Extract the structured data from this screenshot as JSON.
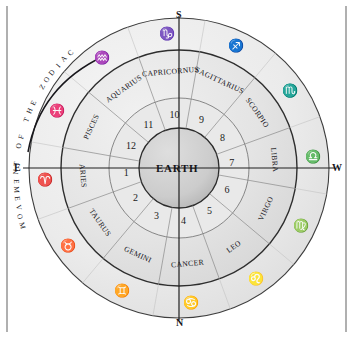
{
  "figure": {
    "center_label": "EARTH",
    "movement_caption": "MOVEMENT OF THE ZODIAC",
    "movement_arrow": "curved-arrow-clockwise"
  },
  "colors": {
    "ink": "#16151a",
    "rule": "#b0b0b0",
    "ring_fill": "#ededed",
    "band_fill": "#e6e6e6",
    "earth_fill": "#cfcfcf",
    "line": "#3a3a3a",
    "spoke": "#8d8d8d",
    "page": "#ffffff"
  },
  "compass": {
    "north": "N",
    "south": "S",
    "east": "E",
    "west": "W"
  },
  "houses": [
    {
      "number": "1",
      "angle_deg": 185
    },
    {
      "number": "2",
      "angle_deg": 215
    },
    {
      "number": "3",
      "angle_deg": 245
    },
    {
      "number": "4",
      "angle_deg": 275
    },
    {
      "number": "5",
      "angle_deg": 305
    },
    {
      "number": "6",
      "angle_deg": 335
    },
    {
      "number": "7",
      "angle_deg": 5
    },
    {
      "number": "8",
      "angle_deg": 35
    },
    {
      "number": "9",
      "angle_deg": 65
    },
    {
      "number": "10",
      "angle_deg": 95
    },
    {
      "number": "11",
      "angle_deg": 125
    },
    {
      "number": "12",
      "angle_deg": 155
    }
  ],
  "signs": [
    {
      "name": "ARIES",
      "glyph": "♈",
      "house": "1",
      "angle_deg": 185
    },
    {
      "name": "TAURUS",
      "glyph": "♉",
      "house": "2",
      "angle_deg": 215
    },
    {
      "name": "GEMINI",
      "glyph": "♊",
      "house": "3",
      "angle_deg": 245
    },
    {
      "name": "CANCER",
      "glyph": "♋",
      "house": "4",
      "angle_deg": 275
    },
    {
      "name": "LEO",
      "glyph": "♌",
      "house": "5",
      "angle_deg": 305
    },
    {
      "name": "VIRGO",
      "glyph": "♍",
      "house": "6",
      "angle_deg": 335
    },
    {
      "name": "LIBRA",
      "glyph": "♎",
      "house": "7",
      "angle_deg": 5
    },
    {
      "name": "SCORPIO",
      "glyph": "♏",
      "house": "8",
      "angle_deg": 35
    },
    {
      "name": "SAGITTARIUS",
      "glyph": "♐",
      "house": "9",
      "angle_deg": 65
    },
    {
      "name": "CAPRICORNUS",
      "glyph": "♑",
      "house": "10",
      "angle_deg": 95
    },
    {
      "name": "AQUARIUS",
      "glyph": "♒",
      "house": "11",
      "angle_deg": 125
    },
    {
      "name": "PISCES",
      "glyph": "♓",
      "house": "12",
      "angle_deg": 155
    }
  ],
  "geometry": {
    "cx": 179,
    "cy": 168,
    "r_outer": 150,
    "r_glyph_ring": 132,
    "r_band_outer": 118,
    "r_name_ring": 96,
    "r_band_inner": 70,
    "r_earth": 40
  }
}
